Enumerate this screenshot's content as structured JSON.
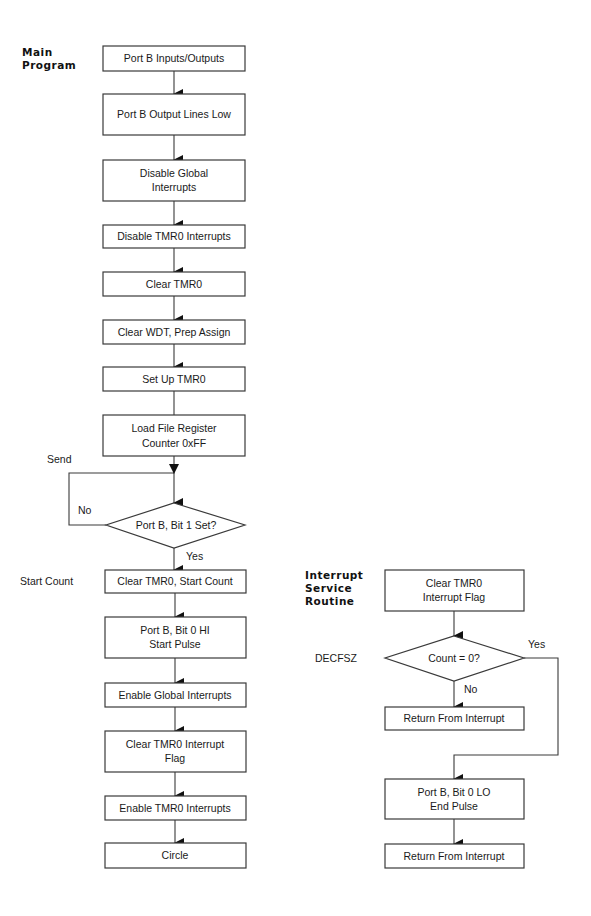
{
  "diagram": {
    "type": "flowchart",
    "colors": {
      "line": "#3a3a3a",
      "arrow": "#111111",
      "text": "#1a1a1a",
      "background": "#ffffff"
    },
    "main": {
      "title_lines": [
        "Main",
        "Program"
      ],
      "nodes": [
        {
          "id": "m1",
          "shape": "box",
          "lines": [
            "Port B Inputs/Outputs"
          ]
        },
        {
          "id": "m2",
          "shape": "box",
          "lines": [
            "Port B Output Lines Low"
          ]
        },
        {
          "id": "m3",
          "shape": "box",
          "lines": [
            "Disable Global",
            "Interrupts"
          ]
        },
        {
          "id": "m4",
          "shape": "box",
          "lines": [
            "Disable TMR0 Interrupts"
          ]
        },
        {
          "id": "m5",
          "shape": "box",
          "lines": [
            "Clear TMR0"
          ]
        },
        {
          "id": "m6",
          "shape": "box",
          "lines": [
            "Clear WDT, Prep Assign"
          ]
        },
        {
          "id": "m7",
          "shape": "box",
          "lines": [
            "Set Up TMR0"
          ]
        },
        {
          "id": "m8",
          "shape": "box",
          "lines": [
            "Load File Register",
            "Counter 0xFF"
          ]
        },
        {
          "id": "m9",
          "shape": "diamond",
          "lines": [
            "Port B, Bit 1 Set?"
          ]
        },
        {
          "id": "m10",
          "shape": "box",
          "lines": [
            "Clear TMR0, Start Count"
          ]
        },
        {
          "id": "m11",
          "shape": "box",
          "lines": [
            "Port B, Bit 0 HI",
            "Start Pulse"
          ]
        },
        {
          "id": "m12",
          "shape": "box",
          "lines": [
            "Enable Global Interrupts"
          ]
        },
        {
          "id": "m13",
          "shape": "box",
          "lines": [
            "Clear TMR0 Interrupt",
            "Flag"
          ]
        },
        {
          "id": "m14",
          "shape": "box",
          "lines": [
            "Enable TMR0  Interrupts"
          ]
        },
        {
          "id": "m15",
          "shape": "box",
          "lines": [
            "Circle"
          ]
        }
      ],
      "labels": {
        "send": "Send",
        "no": "No",
        "yes": "Yes",
        "start_count": "Start Count"
      }
    },
    "isr": {
      "title_lines": [
        "Interrupt",
        "Service",
        "Routine"
      ],
      "nodes": [
        {
          "id": "i1",
          "shape": "box",
          "lines": [
            "Clear TMR0",
            "Interrupt Flag"
          ]
        },
        {
          "id": "i2",
          "shape": "diamond",
          "lines": [
            "Count = 0?"
          ]
        },
        {
          "id": "i3",
          "shape": "box",
          "lines": [
            "Return From Interrupt"
          ]
        },
        {
          "id": "i4",
          "shape": "box",
          "lines": [
            "Port B, Bit 0 LO",
            "End Pulse"
          ]
        },
        {
          "id": "i5",
          "shape": "box",
          "lines": [
            "Return From Interrupt"
          ]
        }
      ],
      "labels": {
        "decfsz": "DECFSZ",
        "yes": "Yes",
        "no": "No"
      }
    }
  }
}
